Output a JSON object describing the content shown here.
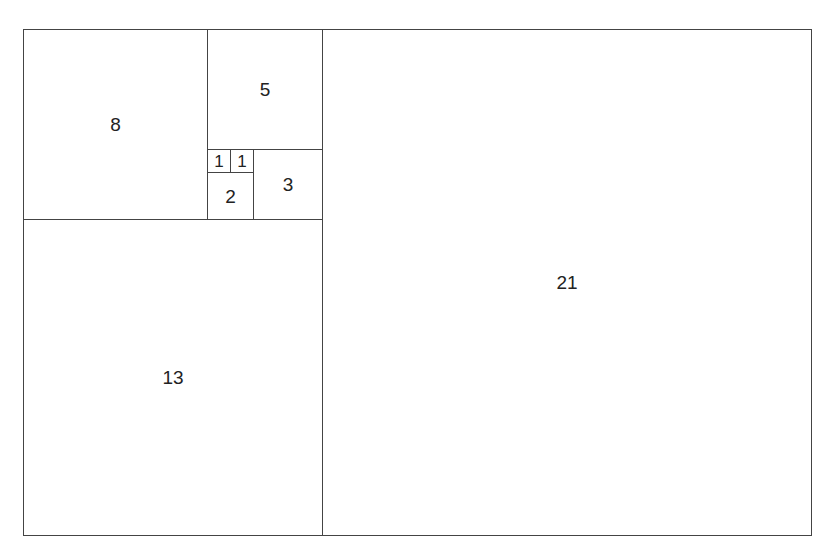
{
  "diagram": {
    "title": "",
    "type": "fibonacci-rectangle",
    "stroke_color": "#444444",
    "background": "#ffffff",
    "squares": [
      {
        "id": "sq-21",
        "label": "21",
        "x": 322,
        "y": 29,
        "w": 490,
        "h": 507
      },
      {
        "id": "sq-13",
        "label": "13",
        "x": 23,
        "y": 219,
        "w": 300,
        "h": 317
      },
      {
        "id": "sq-8",
        "label": "8",
        "x": 23,
        "y": 29,
        "w": 185,
        "h": 191
      },
      {
        "id": "sq-5",
        "label": "5",
        "x": 207,
        "y": 29,
        "w": 116,
        "h": 121
      },
      {
        "id": "sq-3",
        "label": "3",
        "x": 253,
        "y": 149,
        "w": 70,
        "h": 71
      },
      {
        "id": "sq-2",
        "label": "2",
        "x": 207,
        "y": 172,
        "w": 47,
        "h": 48
      },
      {
        "id": "sq-1a",
        "label": "1",
        "x": 207,
        "y": 149,
        "w": 24,
        "h": 24
      },
      {
        "id": "sq-1b",
        "label": "1",
        "x": 230,
        "y": 149,
        "w": 24,
        "h": 24
      }
    ]
  }
}
